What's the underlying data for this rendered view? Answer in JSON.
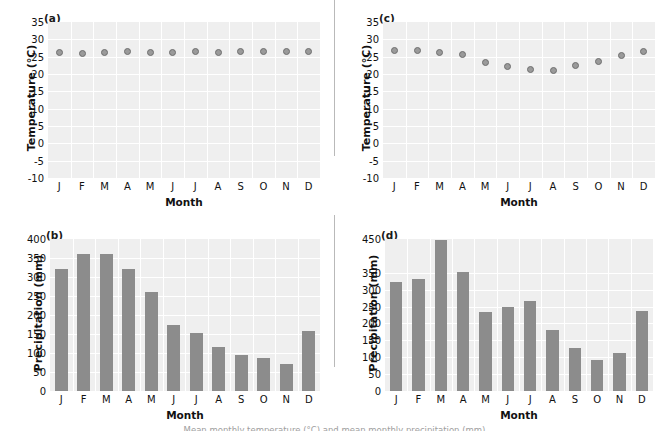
{
  "figure": {
    "caption_partial": "Mean monthly temperature (°C) and mean monthly precipitation (mm)"
  },
  "months": [
    "J",
    "F",
    "M",
    "A",
    "M",
    "J",
    "J",
    "A",
    "S",
    "O",
    "N",
    "D"
  ],
  "chart_data": [
    {
      "panel": "(a)",
      "type": "scatter",
      "title": "",
      "xlabel": "Month",
      "ylabel": "Temperature (°C)",
      "categories": [
        "J",
        "F",
        "M",
        "A",
        "M",
        "J",
        "J",
        "A",
        "S",
        "O",
        "N",
        "D"
      ],
      "values": [
        26.3,
        25.9,
        26.3,
        26.4,
        26.3,
        26.3,
        26.4,
        26.3,
        26.4,
        26.4,
        26.4,
        26.4
      ],
      "ylim": [
        -10,
        35
      ],
      "yticks": [
        -10,
        -5,
        0,
        5,
        10,
        15,
        20,
        25,
        30,
        35
      ],
      "ytick_labels": [
        "-10",
        "-5",
        "0",
        "5",
        "10",
        "15",
        "20",
        "25",
        "30",
        "35"
      ],
      "grid": true,
      "legend": "none"
    },
    {
      "panel": "(b)",
      "type": "bar",
      "title": "",
      "xlabel": "Month",
      "ylabel": "Precipitation (mm)",
      "categories": [
        "J",
        "F",
        "M",
        "A",
        "M",
        "J",
        "J",
        "A",
        "S",
        "O",
        "N",
        "D"
      ],
      "values": [
        322,
        360,
        361,
        322,
        261,
        173,
        153,
        115,
        94,
        88,
        72,
        158
      ],
      "ylim": [
        0,
        400
      ],
      "yticks": [
        0,
        50,
        100,
        150,
        200,
        250,
        300,
        350,
        400
      ],
      "ytick_labels": [
        "0",
        "50",
        "100",
        "150",
        "200",
        "250",
        "300",
        "350",
        "400"
      ],
      "grid": true,
      "legend": "none"
    },
    {
      "panel": "(c)",
      "type": "scatter",
      "title": "",
      "xlabel": "Month",
      "ylabel": "Temperature (°C)",
      "categories": [
        "J",
        "F",
        "M",
        "A",
        "M",
        "J",
        "J",
        "A",
        "S",
        "O",
        "N",
        "D"
      ],
      "values": [
        26.7,
        26.7,
        26.1,
        25.7,
        23.4,
        22.3,
        21.3,
        21.1,
        22.5,
        23.6,
        25.2,
        26.4
      ],
      "ylim": [
        -10,
        35
      ],
      "yticks": [
        -10,
        -5,
        0,
        5,
        10,
        15,
        20,
        25,
        30,
        35
      ],
      "ytick_labels": [
        "-10",
        "-5",
        "0",
        "5",
        "10",
        "15",
        "20",
        "25",
        "30",
        "35"
      ],
      "grid": true,
      "legend": "none"
    },
    {
      "panel": "(d)",
      "type": "bar",
      "title": "",
      "xlabel": "Month",
      "ylabel": "Precipitation (mm)",
      "categories": [
        "J",
        "F",
        "M",
        "A",
        "M",
        "J",
        "J",
        "A",
        "S",
        "O",
        "N",
        "D"
      ],
      "values": [
        323,
        331,
        448,
        352,
        234,
        250,
        266,
        182,
        126,
        93,
        112,
        236
      ],
      "ylim": [
        0,
        450
      ],
      "yticks": [
        0,
        50,
        100,
        150,
        200,
        250,
        300,
        350,
        450
      ],
      "ytick_labels": [
        "0",
        "50",
        "100",
        "150",
        "200",
        "250",
        "300",
        "350",
        "450"
      ],
      "grid": true,
      "legend": "none"
    }
  ],
  "colors": {
    "plot_background": "#efefef",
    "gridline": "#ffffff",
    "marker_fill": "#9a9a9a",
    "marker_edge": "#6f6f6f",
    "bar_fill": "#8c8c8c",
    "axis": "#b9b9b9",
    "text": "#111111"
  }
}
